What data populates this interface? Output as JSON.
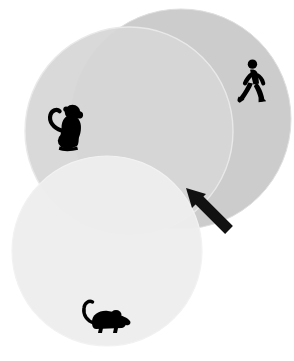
{
  "figure": {
    "background_color": "#ffffff",
    "width": 294,
    "height": 361
  },
  "palette": {
    "circle_human_fill": "#cccccc",
    "circle_monkey_fill": "#d6d6d6",
    "circle_mouse_fill": "#ededed",
    "circle_stroke": "#e8e8e8",
    "icon_color": "#000000",
    "arrow_color": "#111111",
    "overlap_shared": "#c2c2c2"
  },
  "circles": [
    {
      "id": "circle-human",
      "label": "Human",
      "icon": "walking-person-icon",
      "cx": 181,
      "cy": 119,
      "r": 110,
      "fill": "#cccccc",
      "opacity": 1,
      "z": 1
    },
    {
      "id": "circle-monkey",
      "label": "Monkey",
      "icon": "monkey-icon",
      "cx": 129,
      "cy": 131,
      "r": 104,
      "fill": "#d6d6d6",
      "opacity": 0.93,
      "z": 2
    },
    {
      "id": "circle-mouse",
      "label": "Mouse",
      "icon": "mouse-icon",
      "cx": 107,
      "cy": 251,
      "r": 95,
      "fill": "#ededed",
      "opacity": 0.95,
      "z": 3
    }
  ],
  "icons": [
    {
      "id": "walking-person-icon",
      "name": "walking-person-icon",
      "belongs_to": "circle-human",
      "x": 236,
      "y": 59,
      "width": 34,
      "height": 46
    },
    {
      "id": "monkey-icon",
      "name": "monkey-icon",
      "belongs_to": "circle-monkey",
      "x": 44,
      "y": 102,
      "width": 44,
      "height": 50
    },
    {
      "id": "mouse-icon",
      "name": "mouse-icon",
      "belongs_to": "circle-mouse",
      "x": 79,
      "y": 299,
      "width": 48,
      "height": 36
    }
  ],
  "annotation": {
    "id": "pointer-arrow",
    "name": "pointer-arrow-icon",
    "direction": "up-left",
    "tip_x": 187,
    "tip_y": 189,
    "tail_x": 231,
    "tail_y": 231,
    "color": "#111111",
    "points_at": "intersection-of-all-circles"
  }
}
